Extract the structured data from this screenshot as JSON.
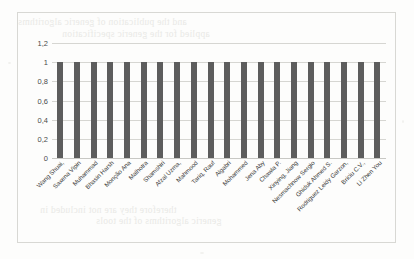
{
  "page": {
    "bleed_through_lines": [
      "and the publication of generic algorithms",
      "applied for the generic specification",
      "therefore they are not included in",
      "generic algorithms of the tools"
    ]
  },
  "chart_data": {
    "type": "bar",
    "title": "",
    "xlabel": "",
    "ylabel": "",
    "ylim": [
      0,
      1.2
    ],
    "yticks": [
      "0",
      "0,2",
      "0,4",
      "0,6",
      "0,8",
      "1",
      "1,2"
    ],
    "ytick_values": [
      0,
      0.2,
      0.4,
      0.6,
      0.8,
      1,
      1.2
    ],
    "grid": true,
    "legend": "none",
    "bar_color": "#5d5d5d",
    "categories": [
      "Wang Shuai,",
      "Saxena Vipin",
      "Muhammad",
      "Bhasin Harsh",
      "Monção Ana",
      "Malhotra",
      "Shamshiri",
      "Afzal Uzma,",
      "Mahmood",
      "Tariq, Rauf",
      "Algabri",
      "Mohammed",
      "Jena Aby",
      "Chawla P.",
      "Xinying, Jiang",
      "Nesmachnow Sergio",
      "Ghiduk Ahmed S.",
      "Rodriguez Leidy Garzon,",
      "Briciu C.V.,",
      "Li Zhen You"
    ],
    "values": [
      1,
      1,
      1,
      1,
      1,
      1,
      1,
      1,
      1,
      1,
      1,
      1,
      1,
      1,
      1,
      1,
      1,
      1,
      1,
      1
    ]
  }
}
